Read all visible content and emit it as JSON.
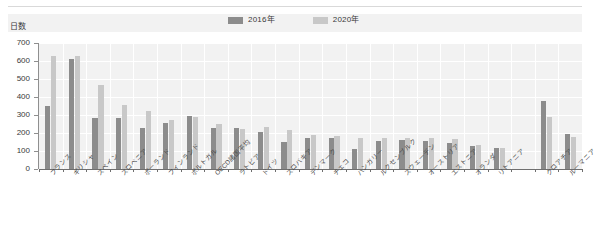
{
  "chart_data": {
    "type": "bar",
    "title": "",
    "xlabel": "",
    "ylabel": "日数",
    "ylim": [
      0,
      700
    ],
    "yticks": [
      0,
      100,
      200,
      300,
      400,
      500,
      600,
      700
    ],
    "grid": true,
    "legend_position": "top",
    "categories": [
      "フランス",
      "ギリシャ",
      "スペイン",
      "スロベニア",
      "ポーランド",
      "フィンランド",
      "ポルトガル",
      "OECD諸国平均",
      "ラトビア",
      "ドイツ",
      "スロバキア",
      "デンマーク",
      "チェコ",
      "ハンガリー",
      "ルクセンブルク",
      "スウェーデン",
      "オーストリア",
      "エストニア",
      "オランダ",
      "リトアニア",
      "",
      "クロアチア",
      "ルーマニア"
    ],
    "series": [
      {
        "name": "2016年",
        "color": "#8c8c8c",
        "values": [
          350,
          610,
          285,
          283,
          230,
          255,
          295,
          230,
          228,
          208,
          150,
          175,
          175,
          110,
          155,
          160,
          155,
          145,
          130,
          115,
          null,
          380,
          195
        ]
      },
      {
        "name": "2020年",
        "color": "#c8c8c8",
        "values": [
          630,
          630,
          465,
          355,
          320,
          275,
          290,
          250,
          225,
          235,
          215,
          190,
          185,
          175,
          175,
          175,
          170,
          165,
          135,
          115,
          null,
          290,
          180
        ]
      }
    ]
  },
  "legend": {
    "items": [
      {
        "label": "2016年",
        "color": "#8c8c8c"
      },
      {
        "label": "2020年",
        "color": "#c8c8c8"
      }
    ]
  },
  "axis": {
    "y_title": "日数",
    "y_tick_labels": [
      "700",
      "600",
      "500",
      "400",
      "300",
      "200",
      "100",
      "0"
    ]
  },
  "colors": {
    "plot_background": "#f2f2f2",
    "legend_background": "#f2f2f2",
    "gridline": "#ffffff",
    "axis_line": "#6f6f6f",
    "text": "#3a3a3a",
    "series_2016": "#8c8c8c",
    "series_2020": "#c8c8c8"
  }
}
